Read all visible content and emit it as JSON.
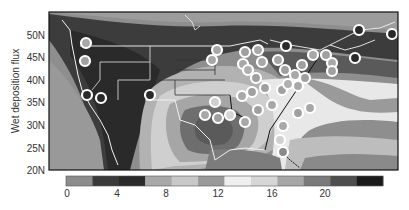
{
  "chart_data": {
    "type": "heatmap",
    "title": "",
    "ylabel": "Wet deposition flux",
    "xlabel": "",
    "y_ticks": [
      "50N",
      "45N",
      "40N",
      "35N",
      "30N",
      "25N",
      "20N"
    ],
    "y_tick_values": [
      50,
      45,
      40,
      35,
      30,
      25,
      20
    ],
    "ylim": [
      20,
      55
    ],
    "colorbar": {
      "ticks": [
        "0",
        "4",
        "8",
        "12",
        "16",
        "20"
      ],
      "tick_values": [
        0,
        4,
        8,
        12,
        16,
        20
      ],
      "range": [
        0,
        24
      ],
      "bins": [
        {
          "from": 0,
          "to": 2,
          "color": "#8c8c8c"
        },
        {
          "from": 2,
          "to": 4,
          "color": "#3a3a3a"
        },
        {
          "from": 4,
          "to": 6,
          "color": "#2a2a2a"
        },
        {
          "from": 6,
          "to": 8,
          "color": "#a8a8a8"
        },
        {
          "from": 8,
          "to": 10,
          "color": "#c8c8c8"
        },
        {
          "from": 10,
          "to": 12,
          "color": "#9a9a9a"
        },
        {
          "from": 12,
          "to": 14,
          "color": "#efefef"
        },
        {
          "from": 14,
          "to": 16,
          "color": "#d6d6d6"
        },
        {
          "from": 16,
          "to": 18,
          "color": "#a6a6a6"
        },
        {
          "from": 18,
          "to": 20,
          "color": "#7a7a7a"
        },
        {
          "from": 20,
          "to": 22,
          "color": "#4e4e4e"
        },
        {
          "from": 22,
          "to": 24,
          "color": "#1a1a1a"
        }
      ]
    },
    "region": "Contiguous United States and southern Canada",
    "grid": false,
    "legend_position": "bottom colorbar",
    "stations_note": "Circular markers are observation sites with white outline; fill shade encodes observed flux on same scale"
  },
  "axis": {
    "ylabel": "Wet deposition flux",
    "ticks": [
      "50N",
      "45N",
      "40N",
      "35N",
      "30N",
      "25N",
      "20N"
    ]
  },
  "colorbar": {
    "labels": [
      "0",
      "4",
      "8",
      "12",
      "16",
      "20"
    ]
  }
}
